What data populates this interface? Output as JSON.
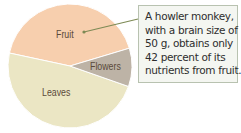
{
  "chart_data": {
    "type": "pie",
    "title": "",
    "categories": [
      "Fruit",
      "Flowers",
      "Leaves"
    ],
    "values": [
      42,
      10,
      48
    ],
    "colors": [
      "#f7cfae",
      "#bdb3a6",
      "#ebe6c4"
    ],
    "legend": "none (direct labels)",
    "annotation": {
      "target": "Fruit",
      "lines": [
        "A howler monkey,",
        "with a brain size of",
        "50 g, obtains only",
        "42 percent of its",
        "nutrients from fruit."
      ]
    }
  },
  "labels": {
    "fruit": "Fruit",
    "flowers": "Flowers",
    "leaves": "Leaves"
  },
  "callout": {
    "line1": "A howler monkey,",
    "line2": "with a brain size of",
    "line3": "50 g, obtains only",
    "line4": "42 percent of its",
    "line5": "nutrients from fruit."
  }
}
